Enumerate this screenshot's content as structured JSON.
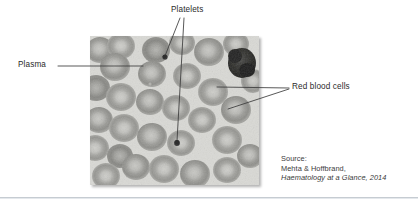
{
  "figure": {
    "image": {
      "alt_name": "blood-smear-micrograph",
      "description": "Grayscale light micrograph of a peripheral blood smear showing red blood cells, platelets and plasma background"
    }
  },
  "labels": {
    "platelets": "Platelets",
    "plasma": "Plasma",
    "red_blood_cells": "Red blood cells"
  },
  "source": {
    "line1": "Source:",
    "line2": "Mehta & Hoffbrand,",
    "line3": "Haematology at a Glance, 2014"
  },
  "colors": {
    "leader_line": "#3b3b3b",
    "label_text": "#2b2b2b",
    "source_text": "#3a3a3a",
    "divider": "#c6ccd2",
    "plasma_background": "#d9d9d5",
    "rbc_rim": "#9a9a96",
    "rbc_center": "#c9c9c5",
    "platelet": "#2e2e2e",
    "white_cell": "#2a2a2a",
    "page_background": "#ffffff"
  }
}
